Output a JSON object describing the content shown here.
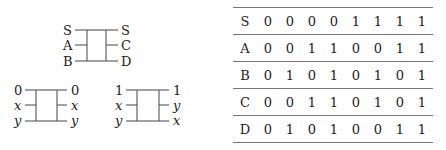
{
  "diagrams": [
    {
      "id": "generic",
      "inputs": [
        "S",
        "A",
        "B"
      ],
      "outputs": [
        "S",
        "C",
        "D"
      ],
      "italic": false
    },
    {
      "id": "control0",
      "inputs": [
        "0",
        "x",
        "y"
      ],
      "outputs": [
        "0",
        "x",
        "y"
      ],
      "italic_rows": [
        1,
        2
      ]
    },
    {
      "id": "control1",
      "inputs": [
        "1",
        "x",
        "y"
      ],
      "outputs": [
        "1",
        "y",
        "x"
      ],
      "italic_rows": [
        1,
        2
      ]
    }
  ],
  "table": {
    "rows": [
      {
        "label": "S",
        "values": [
          "0",
          "0",
          "0",
          "0",
          "1",
          "1",
          "1",
          "1"
        ]
      },
      {
        "label": "A",
        "values": [
          "0",
          "0",
          "1",
          "1",
          "0",
          "0",
          "1",
          "1"
        ]
      },
      {
        "label": "B",
        "values": [
          "0",
          "1",
          "0",
          "1",
          "0",
          "1",
          "0",
          "1"
        ]
      },
      {
        "label": "C",
        "values": [
          "0",
          "0",
          "1",
          "1",
          "0",
          "1",
          "0",
          "1"
        ]
      },
      {
        "label": "D",
        "values": [
          "0",
          "1",
          "0",
          "1",
          "0",
          "0",
          "1",
          "1"
        ]
      }
    ]
  }
}
